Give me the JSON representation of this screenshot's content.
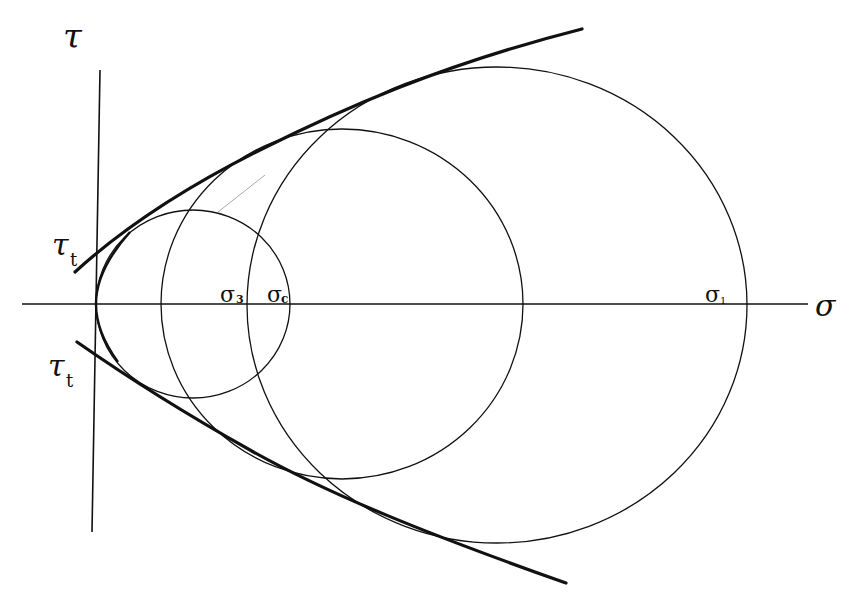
{
  "diagram": {
    "axes": {
      "horizontal_label": "σ",
      "vertical_label": "τ"
    },
    "labels": {
      "tau_t_upper": "τ",
      "tau_t_upper_sub": "t",
      "tau_t_lower": "τ",
      "tau_t_lower_sub": "t",
      "sigma_3": "σ",
      "sigma_3_sub": "3",
      "sigma_c": "σ",
      "sigma_c_sub": "c",
      "sigma_1": "σ",
      "sigma_1_sub": "1"
    },
    "circles": [
      {
        "name": "small",
        "cx": 193,
        "cy": 304,
        "rx": 97,
        "ry": 94
      },
      {
        "name": "medium",
        "cx": 342,
        "cy": 304,
        "rx": 181,
        "ry": 175
      },
      {
        "name": "large",
        "cx": 497,
        "cy": 305,
        "rx": 250,
        "ry": 238
      }
    ],
    "colors": {
      "line": "#111111",
      "background": "#ffffff"
    }
  }
}
